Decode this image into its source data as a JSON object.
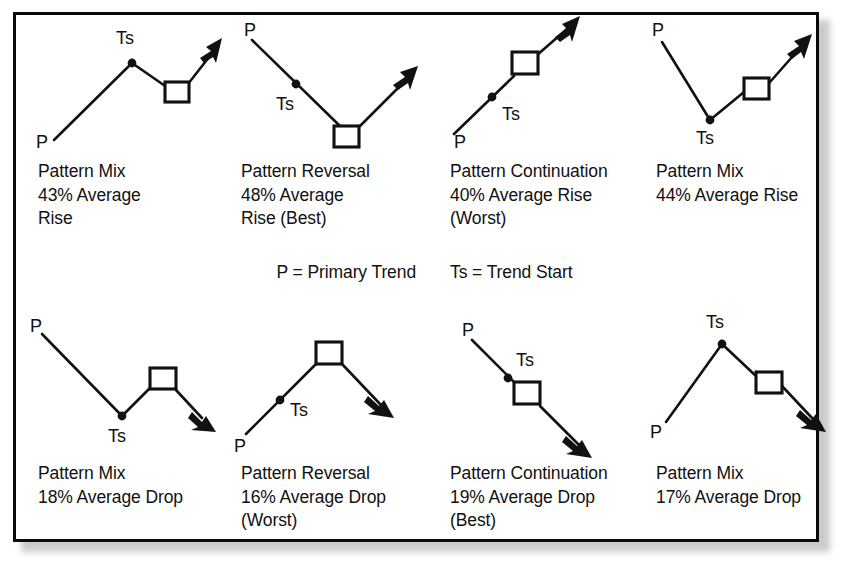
{
  "figure": {
    "legend": {
      "primary_trend": "P = Primary Trend",
      "trend_start": "Ts = Trend Start"
    },
    "label_p": "P",
    "label_ts": "Ts",
    "border_color": "#0a0a0a",
    "ink_color": "#111111",
    "background_color": "#ffffff"
  },
  "panels": [
    {
      "id": "top-1",
      "pattern_type": "Pattern Mix",
      "statistic": "43% Average Rise",
      "rank_note": "",
      "caption": "Pattern Mix\n43% Average\nRise",
      "percent": 43,
      "direction": "Rise",
      "shape": "rise-peak-dip-rise"
    },
    {
      "id": "top-2",
      "pattern_type": "Pattern Reversal",
      "statistic": "48% Average Rise",
      "rank_note": "(Best)",
      "caption": "Pattern Reversal\n48% Average\nRise (Best)",
      "percent": 48,
      "direction": "Rise",
      "shape": "fall-trough-rise"
    },
    {
      "id": "top-3",
      "pattern_type": "Pattern Continuation",
      "statistic": "40% Average Rise",
      "rank_note": "(Worst)",
      "caption": "Pattern Continuation\n40% Average Rise\n(Worst)",
      "percent": 40,
      "direction": "Rise",
      "shape": "straight-rise"
    },
    {
      "id": "top-4",
      "pattern_type": "Pattern Mix",
      "statistic": "44% Average Rise",
      "rank_note": "",
      "caption": "Pattern Mix\n44% Average Rise",
      "percent": 44,
      "direction": "Rise",
      "shape": "fall-trough-rise-late"
    },
    {
      "id": "bottom-1",
      "pattern_type": "Pattern Mix",
      "statistic": "18% Average Drop",
      "rank_note": "",
      "caption": "Pattern Mix\n18% Average Drop",
      "percent": 18,
      "direction": "Drop",
      "shape": "fall-trough-rise-fall"
    },
    {
      "id": "bottom-2",
      "pattern_type": "Pattern Reversal",
      "statistic": "16% Average Drop",
      "rank_note": "(Worst)",
      "caption": "Pattern Reversal\n16% Average Drop\n(Worst)",
      "percent": 16,
      "direction": "Drop",
      "shape": "rise-peak-fall"
    },
    {
      "id": "bottom-3",
      "pattern_type": "Pattern Continuation",
      "statistic": "19% Average Drop",
      "rank_note": "(Best)",
      "caption": "Pattern Continuation\n19% Average Drop\n(Best)",
      "percent": 19,
      "direction": "Drop",
      "shape": "straight-fall"
    },
    {
      "id": "bottom-4",
      "pattern_type": "Pattern Mix",
      "statistic": "17% Average Drop",
      "rank_note": "",
      "caption": "Pattern Mix\n17% Average Drop",
      "percent": 17,
      "direction": "Drop",
      "shape": "rise-peak-fall-late"
    }
  ]
}
